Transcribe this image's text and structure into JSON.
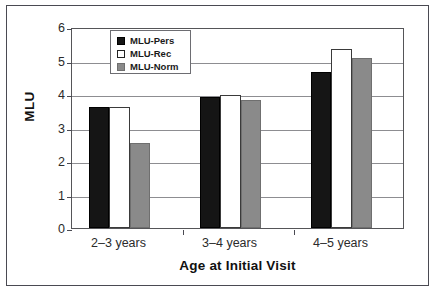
{
  "chart_data": {
    "type": "bar",
    "title": "",
    "xlabel": "Age at Initial Visit",
    "ylabel": "MLU",
    "categories": [
      "2–3 years",
      "3–4 years",
      "4–5 years"
    ],
    "series": [
      {
        "name": "MLU-Pers",
        "color": "#151515",
        "values": [
          3.6,
          3.92,
          4.67
        ]
      },
      {
        "name": "MLU-Rec",
        "color": "#ffffff",
        "values": [
          3.6,
          3.98,
          5.35
        ]
      },
      {
        "name": "MLU-Norm",
        "color": "#8a8a8a",
        "values": [
          2.55,
          3.83,
          5.07
        ]
      }
    ],
    "ylim": [
      0,
      6
    ],
    "yticks": [
      0,
      1,
      2,
      3,
      4,
      5,
      6
    ],
    "ytick_labels": [
      "0",
      "1",
      "2",
      "3",
      "4",
      "5",
      "6"
    ],
    "grid": true,
    "legend_position": "upper-left-inside"
  },
  "axes": {
    "y_title": "MLU",
    "x_title": "Age at Initial Visit"
  },
  "legend": {
    "entries": [
      {
        "label": "MLU-Pers",
        "swatch": "pers"
      },
      {
        "label": "MLU-Rec",
        "swatch": "rec"
      },
      {
        "label": "MLU-Norm",
        "swatch": "norm"
      }
    ]
  }
}
